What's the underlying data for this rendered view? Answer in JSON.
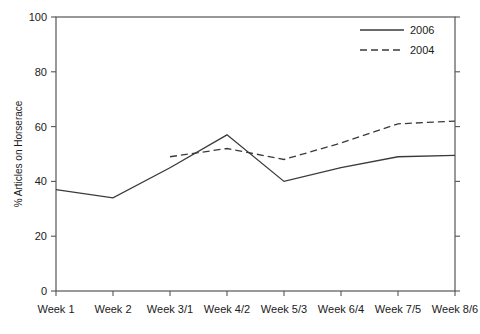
{
  "chart_data": {
    "type": "line",
    "title": "",
    "xlabel": "",
    "ylabel": "% Articles on Horserace",
    "categories": [
      "Week 1",
      "Week 2",
      "Week 3/1",
      "Week 4/2",
      "Week 5/3",
      "Week 6/4",
      "Week 7/5",
      "Week 8/6"
    ],
    "ylim": [
      0,
      100
    ],
    "yticks": [
      0,
      20,
      40,
      60,
      80,
      100
    ],
    "ytick_labels": [
      "0",
      "20",
      "40",
      "60",
      "80",
      "100"
    ],
    "grid": false,
    "legend_position": "top-right",
    "series": [
      {
        "name": "2006",
        "style": "solid",
        "color": "#3a3a3a",
        "x": [
          "Week 1",
          "Week 2",
          "Week 3/1",
          "Week 4/2",
          "Week 5/3",
          "Week 6/4",
          "Week 7/5",
          "Week 8/6"
        ],
        "values": [
          37,
          34,
          45,
          57,
          40,
          45,
          49,
          49.5
        ]
      },
      {
        "name": "2004",
        "style": "dashed",
        "color": "#3a3a3a",
        "x": [
          "Week 3/1",
          "Week 4/2",
          "Week 5/3",
          "Week 6/4",
          "Week 7/5",
          "Week 8/6"
        ],
        "values": [
          49,
          52,
          48,
          54,
          61,
          62
        ]
      }
    ]
  },
  "legend": {
    "entries": [
      {
        "label": "2006",
        "style": "solid"
      },
      {
        "label": "2004",
        "style": "dashed"
      }
    ]
  }
}
